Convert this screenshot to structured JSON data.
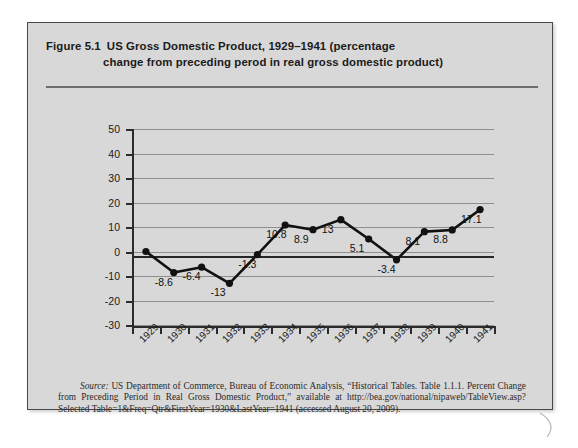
{
  "figure": {
    "label": "Figure 5.1",
    "title_line1": "US Gross Domestic Product, 1929–1941 (percentage",
    "title_line2": "change from preceding perod in real gross domestic product)"
  },
  "source": {
    "word": "Source:",
    "text": " US Department of Commerce, Bureau of Economic Analysis, “Historical Tables. Table 1.1.1. Percent Change from Preceding Period in Real Gross Domestic Product,” available at http://bea.gov/national/nipaweb/TableView.asp?Selected Table=1&Freq=Qtr&FirstYear=1930&LastYear=1941 (accessed August 20, 2009)."
  },
  "chart_data": {
    "type": "line",
    "title": "US Gross Domestic Product, 1929–1941 (percentage change from preceding perod in real gross domestic product)",
    "xlabel": "",
    "ylabel": "",
    "ylim": [
      -30,
      50
    ],
    "ytick_step": 10,
    "grid": true,
    "legend": "none",
    "categories": [
      "1929",
      "1930",
      "1931",
      "1932",
      "1933",
      "1934",
      "1935",
      "1936",
      "1937",
      "1938",
      "1939",
      "1940",
      "1941"
    ],
    "values": [
      0,
      -8.6,
      -6.4,
      -13,
      -1.3,
      10.8,
      8.9,
      13,
      5.1,
      -3.4,
      8.1,
      8.8,
      17.1
    ],
    "yticks": [
      "50",
      "40",
      "30",
      "20",
      "10",
      "0",
      "-10",
      "-20",
      "-30"
    ],
    "point_labels": [
      "-8.6",
      "-6.4",
      "-13",
      "-1.3",
      "10.8",
      "8.9",
      "13",
      "5.1",
      "-3.4",
      "8.1",
      "8.8",
      "17.1"
    ],
    "series_color": "#111111",
    "grid_color": "#8e8e8e",
    "panel_color": "#d8d8d8"
  }
}
